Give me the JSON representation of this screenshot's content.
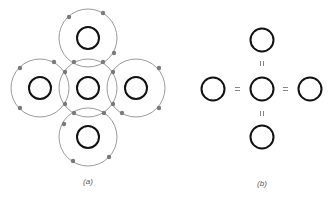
{
  "panels": [
    {
      "id": "a",
      "label": "(a)",
      "description": "Shell diagram: central atom with four surrounding atoms, overlapping outer shells with shared electron pairs",
      "center_atom": {
        "cx": 88,
        "cy": 88
      },
      "outer_atoms": [
        {
          "position": "top",
          "cx": 88,
          "cy": 40
        },
        {
          "position": "left",
          "cx": 40,
          "cy": 88
        },
        {
          "position": "right",
          "cx": 136,
          "cy": 88
        },
        {
          "position": "bottom",
          "cx": 88,
          "cy": 136
        }
      ],
      "inner_radius": 11,
      "shell_radius": 29
    },
    {
      "id": "b",
      "label": "(b)",
      "description": "Structural formula: central atom double-bonded to four atoms",
      "bond_symbol": "=",
      "vertical_bond_symbol": "II",
      "center_atom": {
        "cx": 261,
        "cy": 88
      },
      "outer_atoms": [
        {
          "position": "top",
          "cx": 261,
          "cy": 40
        },
        {
          "position": "left",
          "cx": 213,
          "cy": 88
        },
        {
          "position": "right",
          "cx": 309,
          "cy": 88
        },
        {
          "position": "bottom",
          "cx": 261,
          "cy": 136
        }
      ],
      "atom_radius": 11
    }
  ],
  "colors": {
    "atom_stroke": "#111111",
    "shell_stroke": "#999999",
    "electron_fill": "#777777",
    "label": "#555555"
  }
}
